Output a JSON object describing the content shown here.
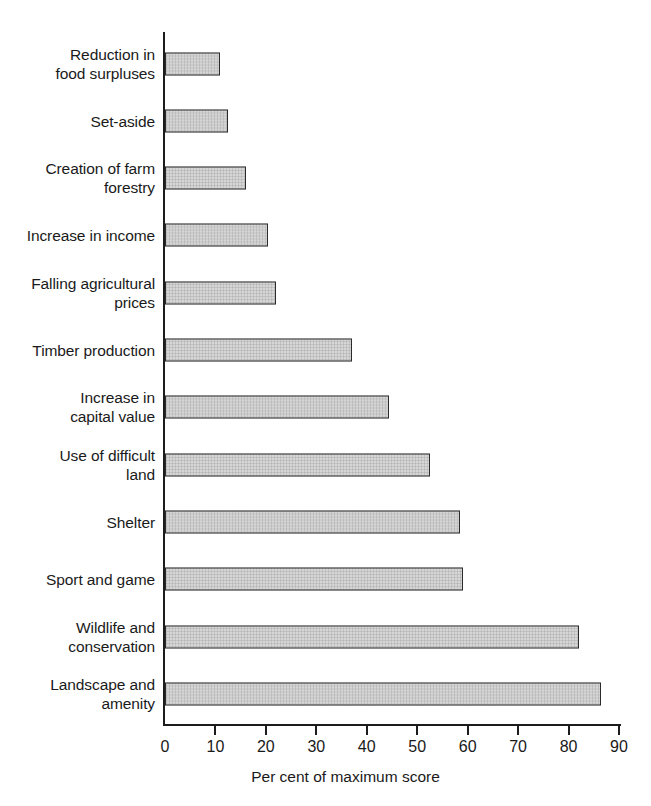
{
  "chart_data": {
    "type": "bar",
    "orientation": "horizontal",
    "title": "",
    "xlabel": "Per cent of maximum score",
    "ylabel": "",
    "xlim": [
      0,
      90
    ],
    "xticks": [
      0,
      10,
      20,
      30,
      40,
      50,
      60,
      70,
      80,
      90
    ],
    "grid": false,
    "legend": null,
    "categories": [
      "Reduction in\nfood surpluses",
      "Set-aside",
      "Creation of farm\nforestry",
      "Increase in income",
      "Falling agricultural\nprices",
      "Timber production",
      "Increase in\ncapital value",
      "Use of difficult\nland",
      "Shelter",
      "Sport and game",
      "Wildlife and\nconservation",
      "Landscape and\namenity"
    ],
    "values": [
      11,
      12.5,
      16,
      20.5,
      22,
      37,
      44.5,
      52.5,
      58.5,
      59,
      82,
      86.5
    ],
    "bar_fill_color": "#d6d6d6",
    "bar_border_color": "#2b2b2b",
    "axis_color": "#1c1c1c"
  },
  "axis": {
    "title": "Per cent of maximum score",
    "tick_labels": [
      "0",
      "10",
      "20",
      "30",
      "40",
      "50",
      "60",
      "70",
      "80",
      "90"
    ]
  },
  "bars": [
    {
      "label": "Reduction in\nfood surpluses",
      "value": 11
    },
    {
      "label": "Set-aside",
      "value": 12.5
    },
    {
      "label": "Creation of farm\nforestry",
      "value": 16
    },
    {
      "label": "Increase in income",
      "value": 20.5
    },
    {
      "label": "Falling agricultural\nprices",
      "value": 22
    },
    {
      "label": "Timber production",
      "value": 37
    },
    {
      "label": "Increase in\ncapital value",
      "value": 44.5
    },
    {
      "label": "Use of difficult\nland",
      "value": 52.5
    },
    {
      "label": "Shelter",
      "value": 58.5
    },
    {
      "label": "Sport and game",
      "value": 59
    },
    {
      "label": "Wildlife and\nconservation",
      "value": 82
    },
    {
      "label": "Landscape and\namenity",
      "value": 86.5
    }
  ]
}
